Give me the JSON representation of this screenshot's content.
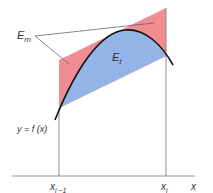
{
  "diagram": {
    "labels": {
      "e_m": "E",
      "e_m_sub": "m",
      "e_t": "E",
      "e_t_sub": "t",
      "function_label": "y = f (x)",
      "x_left": "x",
      "x_left_sub": "i −1",
      "x_right": "x",
      "x_right_sub": "i",
      "x_axis": "x"
    },
    "colors": {
      "midpoint_error_region": "#f08c92",
      "trapezoid_error_region": "#92b4e6",
      "curve": "#111111",
      "lines": "#777777"
    }
  }
}
